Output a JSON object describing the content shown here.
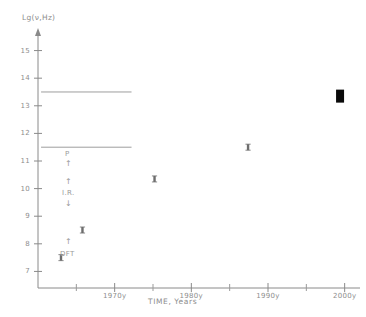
{
  "chart_data": {
    "type": "scatter",
    "title": "",
    "xlabel": "TIME, Years",
    "ylabel": "Lg(ν,Hz)",
    "xlim": [
      1960,
      2002
    ],
    "ylim": [
      15.6,
      6.4
    ],
    "y_axis_inverted": true,
    "grid": false,
    "legend": "none",
    "xticks": [
      1970,
      1980,
      1990,
      2000
    ],
    "xticklabels": [
      "1970y",
      "1980y",
      "1990y",
      "2000y"
    ],
    "xminorticks": [
      1965,
      1975,
      1985,
      1995
    ],
    "yticks": [
      7,
      8,
      9,
      10,
      11,
      12,
      13,
      14,
      15
    ],
    "yticklabels": [
      "7",
      "8",
      "9",
      "10",
      "11",
      "12",
      "13",
      "14",
      "15"
    ],
    "series": [
      {
        "name": "frequency milestones",
        "marker": "small-square",
        "points": [
          {
            "x": 1963.0,
            "y": 7.5
          },
          {
            "x": 1965.8,
            "y": 8.5
          },
          {
            "x": 1975.2,
            "y": 10.35
          },
          {
            "x": 1987.4,
            "y": 11.5
          },
          {
            "x": 1999.4,
            "y": 13.35
          }
        ]
      }
    ],
    "highlight_point": {
      "x": 1999.4,
      "y": 13.35,
      "marker": "large-filled-square"
    },
    "bands": [
      {
        "label": "P",
        "y": 11.15,
        "arrow": "up"
      },
      {
        "label": "I.R.",
        "y": 12.3,
        "arrow_above": "up",
        "arrow_below": "down"
      },
      {
        "label": "DFT",
        "y": 14.5,
        "arrow": "up"
      }
    ],
    "divider_lines": [
      {
        "y": 11.5,
        "x_start": 1960.4,
        "x_end": 1972.2
      },
      {
        "y": 13.5,
        "x_start": 1960.4,
        "x_end": 1972.2
      }
    ]
  },
  "axes": {
    "y_title": "Lg(ν,Hz)",
    "x_title": "TIME, Years",
    "y_ticks": [
      {
        "value": 7,
        "label": "7"
      },
      {
        "value": 8,
        "label": "8"
      },
      {
        "value": 9,
        "label": "9"
      },
      {
        "value": 10,
        "label": "10"
      },
      {
        "value": 11,
        "label": "11"
      },
      {
        "value": 12,
        "label": "12"
      },
      {
        "value": 13,
        "label": "13"
      },
      {
        "value": 14,
        "label": "14"
      },
      {
        "value": 15,
        "label": "15"
      }
    ],
    "x_ticks": [
      {
        "value": 1970,
        "label": "1970y"
      },
      {
        "value": 1980,
        "label": "1980y"
      },
      {
        "value": 1990,
        "label": "1990y"
      },
      {
        "value": 2000,
        "label": "2000y"
      }
    ]
  },
  "annotations": {
    "p_label": "P",
    "ir_label": "I.R.",
    "dft_label": "DFT",
    "arrow_up": "↑",
    "arrow_down": "↓"
  },
  "colors": {
    "axis": "#8a8a8a",
    "text": "#8d8d8d",
    "marker": "#6d6d6d",
    "highlight": "#0a0a0a",
    "divider": "#9d9d9d",
    "background": "#ffffff"
  }
}
